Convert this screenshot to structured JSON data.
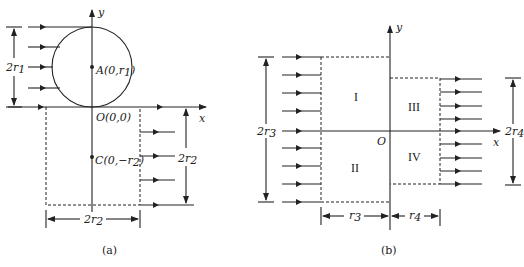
{
  "figure_a": {
    "caption": "(a)",
    "axis_x": "x",
    "axis_y": "y",
    "label_2r1": "2r",
    "label_2r1_sub": "1",
    "point_A": "A(0,r",
    "point_A_sub": "1",
    "point_A_end": ")",
    "point_O": "O(0,0)",
    "point_C": "C(0,−r",
    "point_C_sub": "2",
    "point_C_end": ")",
    "label_2r2_vertical": "2r",
    "label_2r2_vertical_sub": "2",
    "label_2r2_horizontal": "2r",
    "label_2r2_horizontal_sub": "2"
  },
  "figure_b": {
    "caption": "(b)",
    "axis_x": "x",
    "axis_y": "y",
    "origin": "O",
    "region_I": "I",
    "region_II": "II",
    "region_III": "III",
    "region_IV": "IV",
    "label_2r3": "2r",
    "label_2r3_sub": "3",
    "label_2r4": "2r",
    "label_2r4_sub": "4",
    "label_r3": "r",
    "label_r3_sub": "3",
    "label_r4": "r",
    "label_r4_sub": "4"
  }
}
